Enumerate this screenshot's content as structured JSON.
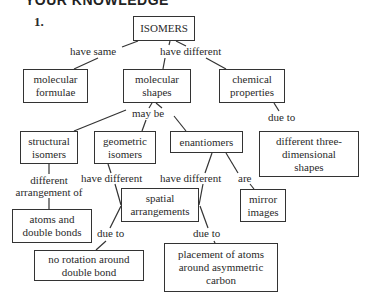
{
  "header": {
    "title": "YOUR KNOWLEDGE",
    "question_number": "1."
  },
  "nodes": {
    "isomers": "ISOMERS",
    "molecular_formulae": "molecular formulae",
    "molecular_shapes": "molecular shapes",
    "chemical_properties": "chemical properties",
    "structural_isomers": "structural isomers",
    "geometric_isomers": "geometric isomers",
    "enantiomers": "enantiomers",
    "different_3d_shapes": "different three-dimensional shapes",
    "atoms_double_bonds": "atoms and double bonds",
    "spatial_arrangements": "spatial arrangements",
    "mirror_images": "mirror images",
    "no_rotation": "no rotation around double bond",
    "placement_atoms": "placement of atoms around asymmetric carbon"
  },
  "links": {
    "have_same": "have same",
    "have_different_top": "have different",
    "may_be": "may  be",
    "due_to_chem": "due to",
    "different_arrangement_of": "different arrangement of",
    "have_different_geo": "have different",
    "have_different_enan": "have different",
    "are": "are",
    "due_to_left": "due to",
    "due_to_right": "due to"
  }
}
